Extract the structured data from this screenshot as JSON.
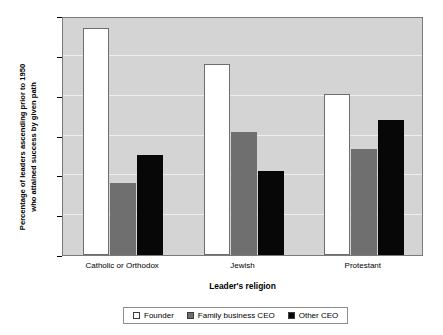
{
  "chart_data": {
    "type": "bar",
    "title": "",
    "xlabel": "Leader's religion",
    "ylabel": "Percentage of leaders ascending prior to 1950 who attained success by given path",
    "ylabel_line1": "Percentage of leaders ascending prior to 1950",
    "ylabel_line2": "who attained success by given path",
    "categories": [
      "Catholic or Orthodox",
      "Jewish",
      "Protestant"
    ],
    "series": [
      {
        "name": "Founder",
        "color": "#ffffff",
        "values": [
          57,
          48,
          40.5
        ]
      },
      {
        "name": "Family business CEO",
        "color": "#6f6f6f",
        "values": [
          18,
          31,
          26.5
        ]
      },
      {
        "name": "Other CEO",
        "color": "#070707",
        "values": [
          25,
          21,
          34
        ]
      }
    ],
    "ylim": [
      0,
      60
    ],
    "yticks": [
      0,
      10,
      20,
      30,
      40,
      50,
      60
    ],
    "ytick_labels": [
      "0",
      "10",
      "20",
      "30",
      "40",
      "50",
      "60"
    ],
    "grid": true,
    "legend_position": "bottom",
    "plot_background": "#d4d4d4",
    "gridline_color": "#efefef"
  }
}
